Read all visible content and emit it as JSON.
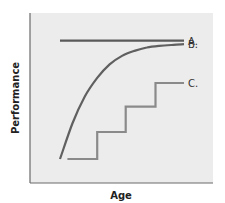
{
  "chart_data": {
    "type": "line",
    "title": "",
    "xlabel": "Age",
    "ylabel": "Performance",
    "xlim": [
      0,
      1
    ],
    "ylim": [
      0,
      1
    ],
    "grid": false,
    "legend": "inline-right",
    "colors": {
      "background": "#ececec",
      "axis": "#6a6a6a",
      "A": "#5a5a5a",
      "B": "#606060",
      "C": "#8a8a8a"
    },
    "series": [
      {
        "name": "A.",
        "kind": "constant",
        "points": [
          [
            0.0,
            0.83
          ],
          [
            1.0,
            0.83
          ]
        ]
      },
      {
        "name": "B.",
        "kind": "saturating-curve",
        "points": [
          [
            0.0,
            0.13
          ],
          [
            0.1,
            0.34
          ],
          [
            0.2,
            0.5
          ],
          [
            0.3,
            0.61
          ],
          [
            0.4,
            0.69
          ],
          [
            0.5,
            0.74
          ],
          [
            0.6,
            0.77
          ],
          [
            0.7,
            0.79
          ],
          [
            0.8,
            0.8
          ],
          [
            0.9,
            0.805
          ],
          [
            1.0,
            0.81
          ]
        ]
      },
      {
        "name": "C.",
        "kind": "step",
        "points": [
          [
            0.06,
            0.13
          ],
          [
            0.3,
            0.13
          ],
          [
            0.3,
            0.29
          ],
          [
            0.53,
            0.29
          ],
          [
            0.53,
            0.44
          ],
          [
            0.77,
            0.44
          ],
          [
            0.77,
            0.58
          ],
          [
            1.0,
            0.58
          ]
        ]
      }
    ]
  }
}
